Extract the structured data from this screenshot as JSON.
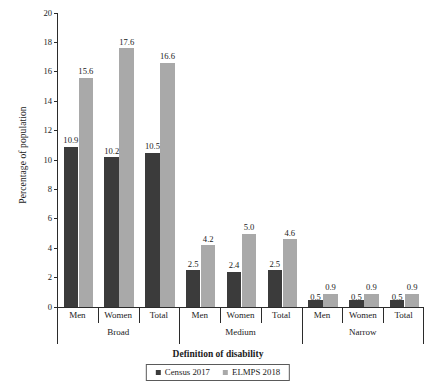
{
  "chart_data": {
    "type": "bar",
    "title": "",
    "xlabel": "Definition of disability",
    "ylabel": "Percentage of population",
    "ylim": [
      0,
      20
    ],
    "yticks": [
      0,
      2,
      4,
      6,
      8,
      10,
      12,
      14,
      16,
      18,
      20
    ],
    "ytick_labels": [
      "0",
      "2",
      "4",
      "6",
      "8",
      "10",
      "12",
      "14",
      "16",
      "18",
      "20"
    ],
    "grid": false,
    "legend_position": "bottom",
    "categories": [
      "Men",
      "Women",
      "Total",
      "Men",
      "Women",
      "Total",
      "Men",
      "Women",
      "Total"
    ],
    "groups": [
      {
        "label": "Broad",
        "categories": [
          "Men",
          "Women",
          "Total"
        ]
      },
      {
        "label": "Medium",
        "categories": [
          "Men",
          "Women",
          "Total"
        ]
      },
      {
        "label": "Narrow",
        "categories": [
          "Men",
          "Women",
          "Total"
        ]
      }
    ],
    "series": [
      {
        "name": "Census 2017",
        "color": "#3b3b3b",
        "values": [
          10.9,
          10.2,
          10.5,
          2.5,
          2.4,
          2.5,
          0.5,
          0.5,
          0.5
        ],
        "labels": [
          "10.9",
          "10.2",
          "10.5",
          "2.5",
          "2.4",
          "2.5",
          "0.5",
          "0.5",
          "0.5"
        ]
      },
      {
        "name": "ELMPS 2018",
        "color": "#a9a9a9",
        "values": [
          15.6,
          17.6,
          16.6,
          4.2,
          5.0,
          4.6,
          0.9,
          0.9,
          0.9
        ],
        "labels": [
          "15.6",
          "17.6",
          "16.6",
          "4.2",
          "5.0",
          "4.6",
          "0.9",
          "0.9",
          "0.9"
        ]
      }
    ]
  },
  "legend": {
    "items": [
      {
        "label": "Census 2017",
        "color": "#3b3b3b"
      },
      {
        "label": "ELMPS 2018",
        "color": "#a9a9a9"
      }
    ]
  }
}
